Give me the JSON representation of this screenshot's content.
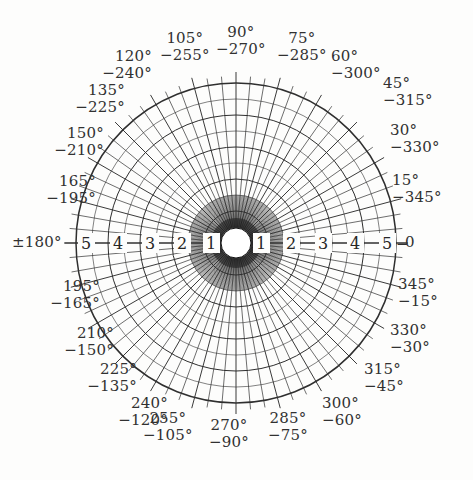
{
  "figure": {
    "kind": "polar-grid-chart",
    "background_color": "#fdfdfc",
    "line_color": "#2f2f2f",
    "text_color": "#313131",
    "center_disc_color": "#ffffff"
  },
  "chart_data": {
    "type": "scatter",
    "title": "",
    "subtitle": "",
    "xlabel": "",
    "ylabel": "",
    "grid": true,
    "legend_position": "none",
    "projection": "polar",
    "center": {
      "x": 236,
      "y": 243
    },
    "outer_radius": 160,
    "inner_hole_radius": 15,
    "angular_tick_step_deg": 5,
    "angular_label_step_deg": 15,
    "radial_ring_values": [
      1,
      2,
      3,
      4,
      5
    ],
    "radial_ring_radii": [
      32,
      64,
      96,
      128,
      160
    ],
    "minor_ring_radii": [
      16,
      48,
      80,
      112,
      144
    ],
    "radial_axis_labels_left": [
      "5",
      "4",
      "3",
      "2",
      "1"
    ],
    "radial_axis_labels_right": [
      "1",
      "2",
      "3",
      "4",
      "5"
    ],
    "axis_start_label": "±180°",
    "axis_end_label": "0",
    "angle_labels": [
      {
        "primary": "0",
        "secondary": "",
        "deg": 0
      },
      {
        "primary": "15°",
        "secondary": "−345°",
        "deg": 15
      },
      {
        "primary": "30°",
        "secondary": "−330°",
        "deg": 30
      },
      {
        "primary": "45°",
        "secondary": "−315°",
        "deg": 45
      },
      {
        "primary": "60°",
        "secondary": "−300°",
        "deg": 60
      },
      {
        "primary": "75°",
        "secondary": "−285°",
        "deg": 75
      },
      {
        "primary": "90°",
        "secondary": "−270°",
        "deg": 90
      },
      {
        "primary": "105°",
        "secondary": "−255°",
        "deg": 105
      },
      {
        "primary": "120°",
        "secondary": "−240°",
        "deg": 120
      },
      {
        "primary": "135°",
        "secondary": "−225°",
        "deg": 135
      },
      {
        "primary": "150°",
        "secondary": "−210°",
        "deg": 150
      },
      {
        "primary": "165°",
        "secondary": "−195°",
        "deg": 165
      },
      {
        "primary": "±180°",
        "secondary": "",
        "deg": 180
      },
      {
        "primary": "195°",
        "secondary": "−165°",
        "deg": 195
      },
      {
        "primary": "210°",
        "secondary": "−150°",
        "deg": 210
      },
      {
        "primary": "225°",
        "secondary": "−135°",
        "deg": 225
      },
      {
        "primary": "240°",
        "secondary": "−120°",
        "deg": 240
      },
      {
        "primary": "255°",
        "secondary": "−105°",
        "deg": 255
      },
      {
        "primary": "270°",
        "secondary": "−90°",
        "deg": 270
      },
      {
        "primary": "285°",
        "secondary": "−75°",
        "deg": 285
      },
      {
        "primary": "300°",
        "secondary": "−60°",
        "deg": 300
      },
      {
        "primary": "315°",
        "secondary": "−45°",
        "deg": 315
      },
      {
        "primary": "330°",
        "secondary": "−30°",
        "deg": 330
      },
      {
        "primary": "345°",
        "secondary": "−15°",
        "deg": 345
      }
    ]
  },
  "labels": {
    "a0": {
      "p": "0",
      "s": ""
    },
    "a15": {
      "p": "15°",
      "s": "−345°"
    },
    "a30": {
      "p": "30°",
      "s": "−330°"
    },
    "a45": {
      "p": "45°",
      "s": "−315°"
    },
    "a60": {
      "p": "60°",
      "s": "−300°"
    },
    "a75": {
      "p": "75°",
      "s": "−285°"
    },
    "a90": {
      "p": "90°",
      "s": "−270°"
    },
    "a105": {
      "p": "105°",
      "s": "−255°"
    },
    "a120": {
      "p": "120°",
      "s": "−240°"
    },
    "a135": {
      "p": "135°",
      "s": "−225°"
    },
    "a150": {
      "p": "150°",
      "s": "−210°"
    },
    "a165": {
      "p": "165°",
      "s": "−195°"
    },
    "a180": {
      "p": "±180°",
      "s": ""
    },
    "a195": {
      "p": "195°",
      "s": "−165°"
    },
    "a210": {
      "p": "210°",
      "s": "−150°"
    },
    "a225": {
      "p": "225°",
      "s": "−135°"
    },
    "a240": {
      "p": "240°",
      "s": "−120°"
    },
    "a255": {
      "p": "255°",
      "s": "−105°"
    },
    "a270": {
      "p": "270°",
      "s": "−90°"
    },
    "a285": {
      "p": "285°",
      "s": "−75°"
    },
    "a300": {
      "p": "300°",
      "s": "−60°"
    },
    "a315": {
      "p": "315°",
      "s": "−45°"
    },
    "a330": {
      "p": "330°",
      "s": "−30°"
    },
    "a345": {
      "p": "345°",
      "s": "−15°"
    }
  },
  "radial": {
    "left": {
      "r5": "5",
      "r4": "4",
      "r3": "3",
      "r2": "2",
      "r1": "1"
    },
    "right": {
      "r1": "1",
      "r2": "2",
      "r3": "3",
      "r4": "4",
      "r5": "5"
    },
    "dash": "—",
    "end_dash": "−"
  }
}
